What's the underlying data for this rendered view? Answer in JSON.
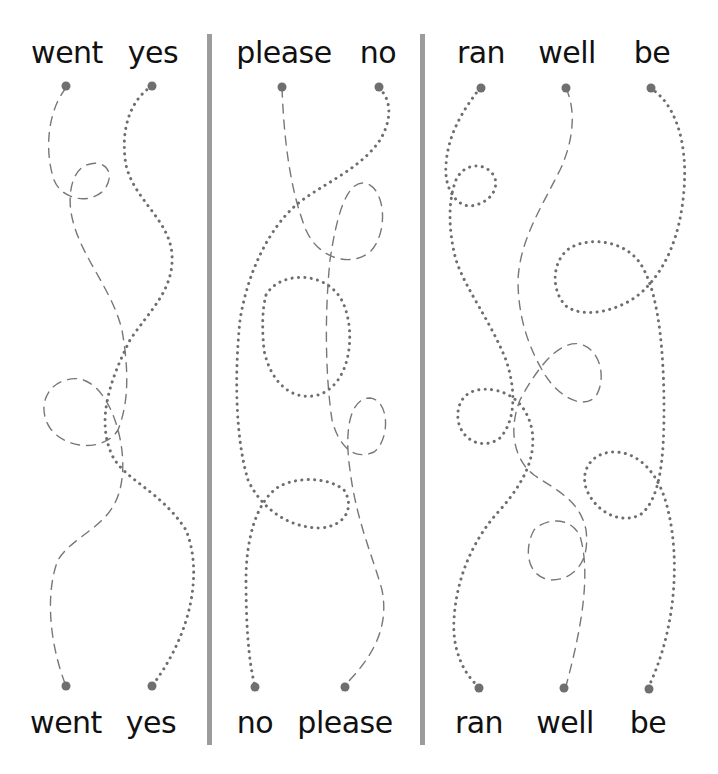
{
  "worksheet": {
    "type": "trace-the-path word matching",
    "panels": [
      {
        "id": "panel-1",
        "top_words": [
          "went",
          "yes"
        ],
        "bottom_words": [
          "went",
          "yes"
        ]
      },
      {
        "id": "panel-2",
        "top_words": [
          "please",
          "no"
        ],
        "bottom_words": [
          "no",
          "please"
        ]
      },
      {
        "id": "panel-3",
        "top_words": [
          "ran",
          "well",
          "be"
        ],
        "bottom_words": [
          "ran",
          "well",
          "be"
        ]
      }
    ],
    "colors": {
      "background": "#ffffff",
      "divider": "#9c9c9c",
      "path": "#777777",
      "endpoint": "#6f6f6f",
      "text": "#111111"
    }
  }
}
